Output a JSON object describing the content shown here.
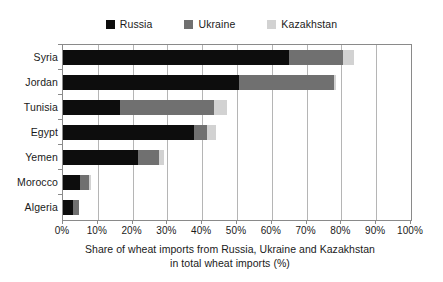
{
  "chart_data": {
    "type": "bar",
    "orientation": "horizontal",
    "stacked": true,
    "title": "",
    "xlabel": "Share of wheat imports from Russia, Ukraine and Kazakhstan in total wheat imports (%)",
    "xlabel_lines": [
      "Share of wheat imports from Russia, Ukraine and Kazakhstan",
      "in total wheat imports (%)"
    ],
    "ylabel": "",
    "categories": [
      "Syria",
      "Jordan",
      "Tunisia",
      "Egypt",
      "Yemen",
      "Morocco",
      "Algeria"
    ],
    "series": [
      {
        "name": "Russia",
        "color": "#0d0d0d",
        "values": [
          65.0,
          50.5,
          16.5,
          37.5,
          21.5,
          5.0,
          3.0
        ]
      },
      {
        "name": "Ukraine",
        "color": "#707070",
        "values": [
          15.5,
          27.5,
          27.0,
          4.0,
          6.0,
          2.5,
          1.5
        ]
      },
      {
        "name": "Kazakhstan",
        "color": "#d2d2d2",
        "values": [
          3.0,
          0.5,
          3.5,
          2.5,
          1.5,
          0.5,
          0.0
        ]
      }
    ],
    "totals": [
      83.5,
      78.5,
      47.0,
      44.0,
      29.0,
      8.0,
      4.5
    ],
    "xlim": [
      0,
      100
    ],
    "x_tick_values": [
      0,
      10,
      20,
      30,
      40,
      50,
      60,
      70,
      80,
      90,
      100
    ],
    "x_tick_labels": [
      "0%",
      "10%",
      "20%",
      "30%",
      "40%",
      "50%",
      "60%",
      "70%",
      "80%",
      "90%",
      "100%"
    ],
    "grid": true,
    "grid_axis": "x",
    "legend_position": "top-center",
    "legend": [
      {
        "label": "Russia",
        "color": "#0d0d0d"
      },
      {
        "label": "Ukraine",
        "color": "#707070"
      },
      {
        "label": "Kazakhstan",
        "color": "#d2d2d2"
      }
    ],
    "colors": {
      "russia": "#0d0d0d",
      "ukraine": "#707070",
      "kazakhstan": "#d2d2d2",
      "axis": "#8a8a8a",
      "gridline": "#b5b5b5",
      "background": "#ffffff",
      "text": "#1a1a1a"
    }
  }
}
